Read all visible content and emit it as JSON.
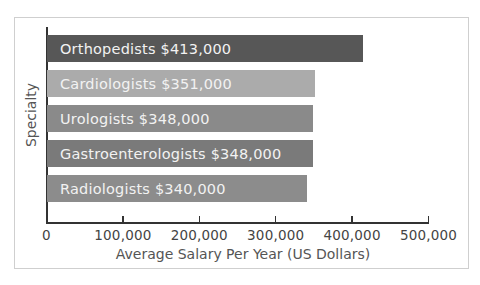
{
  "chart_data": {
    "type": "bar",
    "orientation": "horizontal",
    "title": "",
    "xlabel": "Average Salary Per Year (US Dollars)",
    "ylabel": "Specialty",
    "xlim": [
      0,
      500000
    ],
    "xticks": [
      0,
      100000,
      200000,
      300000,
      400000,
      500000
    ],
    "xtick_labels": [
      "0",
      "100,000",
      "200,000",
      "300,000",
      "400,000",
      "500,000"
    ],
    "grid": false,
    "legend": null,
    "categories": [
      "Orthopedists",
      "Cardiologists",
      "Urologists",
      "Gastroenterologists",
      "Radiologists"
    ],
    "values": [
      413000,
      351000,
      348000,
      348000,
      340000
    ],
    "bar_labels": [
      "Orthopedists $413,000",
      "Cardiologists $351,000",
      "Urologists $348,000",
      "Gastroenterologists $348,000",
      "Radiologists $340,000"
    ],
    "colors": [
      "#575757",
      "#ababab",
      "#8a8a8a",
      "#7a7a7a",
      "#8c8c8c"
    ]
  }
}
